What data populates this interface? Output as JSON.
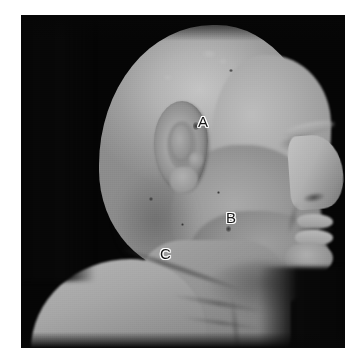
{
  "figure": {
    "type": "clinical-photograph",
    "modality": "grayscale-photograph",
    "view": "right-lateral-profile",
    "background_color": "#070707",
    "mount_color": "#ffffff",
    "plate": {
      "x": 21,
      "y": 15,
      "width": 324,
      "height": 333
    }
  },
  "annotations": [
    {
      "id": "label-a",
      "text": "A",
      "x": 198,
      "y": 114,
      "region": "preauricular / anterior to tragus",
      "marker": {
        "x": 193,
        "y": 122,
        "size": 5,
        "kind": "dark-lesion"
      }
    },
    {
      "id": "label-b",
      "text": "B",
      "x": 226,
      "y": 210,
      "region": "mandible / lower cheek",
      "marker": {
        "x": 226,
        "y": 226,
        "size": 4,
        "kind": "dark-lesion"
      }
    },
    {
      "id": "label-c",
      "text": "C",
      "x": 160,
      "y": 246,
      "region": "lateral neck / supraclavicular",
      "marker": null
    }
  ],
  "palette": {
    "background": "#070707",
    "skin_highlight": "#c4c4c4",
    "skin_mid": "#a0a0a0",
    "skin_shadow": "#7a7a7a",
    "label_fill": "#161616",
    "label_outline": "#fdfdfd"
  }
}
